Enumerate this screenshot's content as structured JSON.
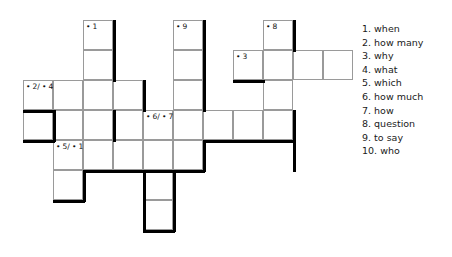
{
  "puzzle": {
    "type": "crossword",
    "cell_size": 30,
    "origin": {
      "x": 23,
      "y": 20
    },
    "columns": 11,
    "rows": 8,
    "grid_rows": [
      {
        "row": 0,
        "y": 20,
        "cells": [
          {
            "col": 2,
            "x": 83,
            "label": "• 1"
          },
          {
            "col": 5,
            "x": 173,
            "label": "• 9"
          },
          {
            "col": 8,
            "x": 263,
            "label": "• 8"
          }
        ]
      },
      {
        "row": 1,
        "y": 50,
        "cells": [
          {
            "col": 2,
            "x": 83,
            "label": ""
          },
          {
            "col": 5,
            "x": 173,
            "label": ""
          },
          {
            "col": 7,
            "x": 233,
            "label": "• 3"
          },
          {
            "col": 8,
            "x": 263,
            "label": ""
          },
          {
            "col": 9,
            "x": 293,
            "label": ""
          },
          {
            "col": 10,
            "x": 323,
            "label": ""
          }
        ]
      },
      {
        "row": 2,
        "y": 80,
        "cells": [
          {
            "col": 0,
            "x": 23,
            "label": "• 2/ • 4"
          },
          {
            "col": 1,
            "x": 53,
            "label": ""
          },
          {
            "col": 2,
            "x": 83,
            "label": ""
          },
          {
            "col": 3,
            "x": 113,
            "label": ""
          },
          {
            "col": 5,
            "x": 173,
            "label": ""
          },
          {
            "col": 8,
            "x": 263,
            "label": ""
          }
        ]
      },
      {
        "row": 3,
        "y": 110,
        "cells": [
          {
            "col": 0,
            "x": 23,
            "label": ""
          },
          {
            "col": 1,
            "x": 53,
            "label": ""
          },
          {
            "col": 2,
            "x": 83,
            "label": ""
          },
          {
            "col": 3,
            "x": 113,
            "label": ""
          },
          {
            "col": 4,
            "x": 143,
            "label": "• 6/ • 7"
          },
          {
            "col": 5,
            "x": 173,
            "label": ""
          },
          {
            "col": 6,
            "x": 203,
            "label": ""
          },
          {
            "col": 7,
            "x": 233,
            "label": ""
          },
          {
            "col": 8,
            "x": 263,
            "label": ""
          }
        ]
      },
      {
        "row": 4,
        "y": 140,
        "cells": [
          {
            "col": 1,
            "x": 53,
            "label": "• 5/ • 1"
          },
          {
            "col": 2,
            "x": 83,
            "label": ""
          },
          {
            "col": 3,
            "x": 113,
            "label": ""
          },
          {
            "col": 4,
            "x": 143,
            "label": ""
          },
          {
            "col": 5,
            "x": 173,
            "label": ""
          }
        ]
      },
      {
        "row": 5,
        "y": 170,
        "cells": [
          {
            "col": 1,
            "x": 53,
            "label": ""
          },
          {
            "col": 4,
            "x": 143,
            "label": ""
          }
        ]
      },
      {
        "row": 6,
        "y": 200,
        "cells": [
          {
            "col": 4,
            "x": 143,
            "label": ""
          }
        ]
      }
    ],
    "numbered_cells": [
      {
        "number": "1",
        "label": "• 1",
        "x": 83,
        "y": 20
      },
      {
        "number": "9",
        "label": "• 9",
        "x": 173,
        "y": 20
      },
      {
        "number": "8",
        "label": "• 8",
        "x": 263,
        "y": 20
      },
      {
        "number": "3",
        "label": "• 3",
        "x": 233,
        "y": 50
      },
      {
        "number": "2/4",
        "label": "• 2/ • 4",
        "x": 23,
        "y": 80
      },
      {
        "number": "6/7",
        "label": "• 6/ • 7",
        "x": 143,
        "y": 110
      },
      {
        "number": "5/1",
        "label": "• 5/ • 1",
        "x": 53,
        "y": 140
      }
    ],
    "heavy_edges": [
      {
        "orient": "v",
        "x": 113,
        "y": 20,
        "len": 62
      },
      {
        "orient": "v",
        "x": 203,
        "y": 20,
        "len": 92
      },
      {
        "orient": "v",
        "x": 293,
        "y": 20,
        "len": 32
      },
      {
        "orient": "h",
        "x": 233,
        "y": 80,
        "len": 32
      },
      {
        "orient": "v",
        "x": 143,
        "y": 80,
        "len": 32
      },
      {
        "orient": "h",
        "x": 23,
        "y": 110,
        "len": 32
      },
      {
        "orient": "v",
        "x": 53,
        "y": 110,
        "len": 32
      },
      {
        "orient": "v",
        "x": 113,
        "y": 110,
        "len": 32
      },
      {
        "orient": "v",
        "x": 293,
        "y": 110,
        "len": 62
      },
      {
        "orient": "h",
        "x": 23,
        "y": 140,
        "len": 32
      },
      {
        "orient": "h",
        "x": 203,
        "y": 140,
        "len": 92
      },
      {
        "orient": "v",
        "x": 203,
        "y": 140,
        "len": 32
      },
      {
        "orient": "h",
        "x": 83,
        "y": 170,
        "len": 122
      },
      {
        "orient": "v",
        "x": 83,
        "y": 170,
        "len": 32
      },
      {
        "orient": "v",
        "x": 173,
        "y": 170,
        "len": 62
      },
      {
        "orient": "h",
        "x": 53,
        "y": 200,
        "len": 32
      },
      {
        "orient": "h",
        "x": 143,
        "y": 230,
        "len": 32
      },
      {
        "orient": "v",
        "x": 143,
        "y": 170,
        "len": 62
      }
    ]
  },
  "clues": {
    "items": [
      {
        "num": "1.",
        "text": "when"
      },
      {
        "num": "2.",
        "text": "how many"
      },
      {
        "num": "3.",
        "text": "why"
      },
      {
        "num": "4.",
        "text": "what"
      },
      {
        "num": "5.",
        "text": "which"
      },
      {
        "num": "6.",
        "text": "how much"
      },
      {
        "num": "7.",
        "text": "how"
      },
      {
        "num": "8.",
        "text": "question"
      },
      {
        "num": "9.",
        "text": "to say"
      },
      {
        "num": "10.",
        "text": "who"
      }
    ]
  },
  "colors": {
    "cell_fill": "#ffffff",
    "cell_border": "#9a9a9a",
    "heavy_border": "#000000",
    "text": "#1a1a1a",
    "background": "#ffffff"
  }
}
